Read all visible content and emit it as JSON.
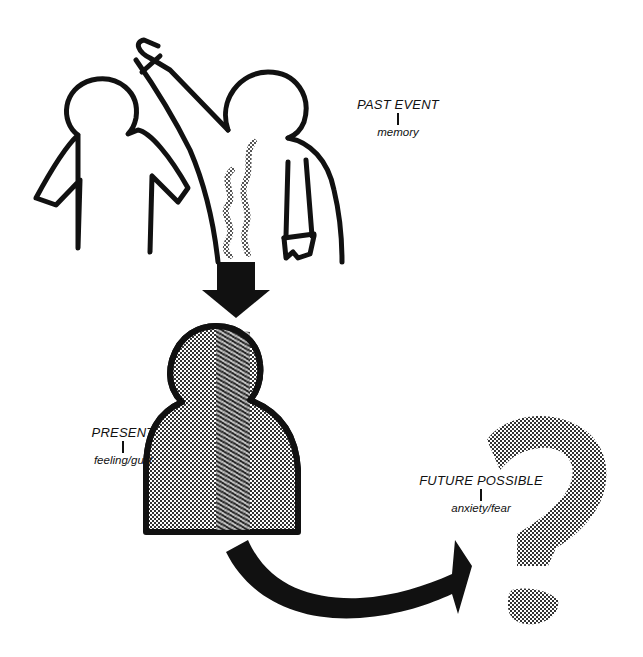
{
  "diagram": {
    "colors": {
      "ink": "#111111",
      "stipple": "#7a7a7a",
      "background": "#ffffff"
    },
    "labels": {
      "past": {
        "title": "PAST EVENT",
        "subtitle": "memory"
      },
      "present": {
        "title": "PRESENT",
        "subtitle": "feeling/guilt"
      },
      "future": {
        "title": "FUTURE POSSIBLE",
        "subtitle": "anxiety/fear"
      }
    },
    "elements": [
      {
        "id": "accused-figure",
        "description": "outlined person figure on left"
      },
      {
        "id": "accuser-figure",
        "description": "outlined person pointing at the other figure"
      },
      {
        "id": "steam-lines",
        "description": "stippled wavy lines"
      },
      {
        "id": "down-arrow",
        "description": "black arrow from past to present"
      },
      {
        "id": "present-figure",
        "description": "stippled figure with dark vertical band"
      },
      {
        "id": "curved-arrow",
        "description": "black curved arrow from present to future"
      },
      {
        "id": "question-mark",
        "description": "stippled question mark"
      }
    ]
  }
}
